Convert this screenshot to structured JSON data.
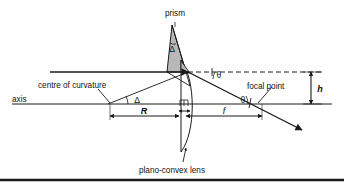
{
  "figure": {
    "type": "optics-ray-diagram",
    "title_visible": false,
    "background_color": "#ffffff",
    "line_color": "#1a1a1a",
    "prism_fill_color": "#b3b3b3",
    "labels": {
      "prism": "prism",
      "centre_of_curvature": "centre of curvature",
      "axis": "axis",
      "focal_point": "focal point",
      "plano_convex_lens": "plano-convex lens"
    },
    "symbols": {
      "prism_apex_angle": "Δ",
      "curvature_angle": "Δ",
      "upper_theta": "θ",
      "lower_theta": "θ",
      "radius": "R",
      "focal_length": "f",
      "height": "h"
    },
    "dimensions": [
      {
        "name": "radius-of-curvature",
        "symbol": "R",
        "from": "centre-of-curvature",
        "to": "lens-plane"
      },
      {
        "name": "focal-length",
        "symbol": "f",
        "from": "lens-vertex",
        "to": "focal-point"
      },
      {
        "name": "ray-height",
        "symbol": "h",
        "from": "optical-axis",
        "to": "incident-ray"
      },
      {
        "name": "lens-thickness",
        "symbol": "",
        "from": "lens-flat-face",
        "to": "lens-curved-vertex"
      }
    ],
    "angles": [
      {
        "name": "prism-apex",
        "symbol": "Δ"
      },
      {
        "name": "centre-of-curvature",
        "symbol": "Δ"
      },
      {
        "name": "deviation-upper",
        "symbol": "θ"
      },
      {
        "name": "deviation-lower",
        "symbol": "θ"
      }
    ]
  }
}
